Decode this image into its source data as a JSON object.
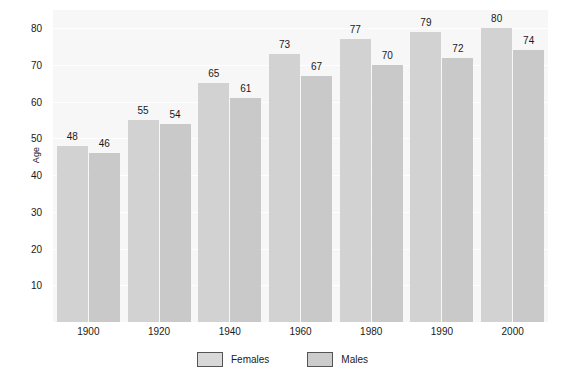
{
  "chart_data": {
    "type": "bar",
    "title": "",
    "xlabel": "",
    "ylabel": "Age",
    "categories": [
      "1900",
      "1920",
      "1940",
      "1960",
      "1980",
      "1990",
      "2000"
    ],
    "series": [
      {
        "name": "Females",
        "values": [
          48,
          55,
          65,
          73,
          77,
          79,
          80
        ],
        "color": "#d2d2d2"
      },
      {
        "name": "Males",
        "values": [
          46,
          54,
          61,
          67,
          70,
          72,
          74
        ],
        "color": "#c9c9c9"
      }
    ],
    "ylim": [
      0,
      85
    ],
    "yticks": [
      10,
      20,
      30,
      40,
      50,
      60,
      70,
      80
    ],
    "ytick_labels": [
      "10",
      "20",
      "30",
      "40",
      "50",
      "60",
      "70",
      "80"
    ],
    "grid": true,
    "grid_axis": "y",
    "legend_position": "bottom",
    "show_value_labels": true,
    "plot_background": "#f7f7f7",
    "figure_background": "#ffffff"
  },
  "legend": {
    "items": [
      {
        "label": "Females",
        "swatch": "female-swatch"
      },
      {
        "label": "Males",
        "swatch": "male-swatch"
      }
    ]
  }
}
